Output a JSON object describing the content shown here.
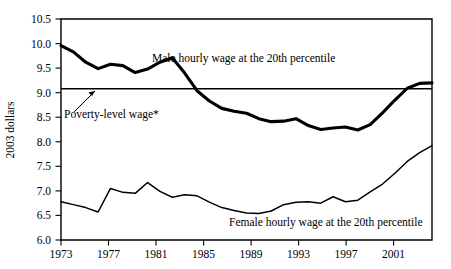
{
  "chart_data": {
    "type": "line",
    "title": "",
    "xlabel": "",
    "ylabel": "2003 dollars",
    "xlim": [
      1973,
      2003
    ],
    "ylim": [
      6.0,
      10.5
    ],
    "grid": false,
    "legend_position": "inline-annotation",
    "x_tick_labels": [
      "1973",
      "1977",
      "1981",
      "1985",
      "1989",
      "1993",
      "1997",
      "2001"
    ],
    "x_ticks": [
      1973,
      1977,
      1981,
      1985,
      1989,
      1993,
      1997,
      2001
    ],
    "y_tick_labels": [
      "6.0",
      "6.5",
      "7.0",
      "7.5",
      "8.0",
      "8.5",
      "9.0",
      "9.5",
      "10.0",
      "10.5"
    ],
    "y_ticks": [
      6.0,
      6.5,
      7.0,
      7.5,
      8.0,
      8.5,
      9.0,
      9.5,
      10.0,
      10.5
    ],
    "x": [
      1973,
      1974,
      1975,
      1976,
      1977,
      1978,
      1979,
      1980,
      1981,
      1982,
      1983,
      1984,
      1985,
      1986,
      1987,
      1988,
      1989,
      1990,
      1991,
      1992,
      1993,
      1994,
      1995,
      1996,
      1997,
      1998,
      1999,
      2000,
      2001,
      2002,
      2003
    ],
    "series": [
      {
        "name": "Male hourly wage at the 20th percentile",
        "style": "thick-black-line",
        "values": [
          9.96,
          9.83,
          9.62,
          9.49,
          9.58,
          9.55,
          9.41,
          9.48,
          9.62,
          9.71,
          9.4,
          9.04,
          8.83,
          8.68,
          8.62,
          8.58,
          8.47,
          8.41,
          8.42,
          8.47,
          8.33,
          8.25,
          8.28,
          8.3,
          8.24,
          8.35,
          8.59,
          8.85,
          9.09,
          9.19,
          9.2
        ]
      },
      {
        "name": "Female hourly wage at the 20th percentile",
        "style": "thin-black-line",
        "values": [
          6.78,
          6.72,
          6.66,
          6.57,
          7.05,
          6.97,
          6.95,
          7.17,
          6.99,
          6.87,
          6.92,
          6.9,
          6.77,
          6.66,
          6.6,
          6.55,
          6.54,
          6.59,
          6.72,
          6.77,
          6.78,
          6.75,
          6.88,
          6.78,
          6.81,
          6.98,
          7.14,
          7.36,
          7.6,
          7.78,
          7.92
        ]
      }
    ],
    "reference_lines": [
      {
        "name": "Poverty-level wage*",
        "value": 9.08,
        "label": "Poverty-level wage*",
        "style": "horizontal-rule"
      }
    ],
    "annotations": [
      {
        "name": "male-series-annotation",
        "text": "Male hourly wage at the 20th percentile"
      },
      {
        "name": "female-series-annotation",
        "text": "Female hourly wage at the 20th percentile"
      },
      {
        "name": "poverty-line-annotation",
        "text": "Poverty-level wage*"
      }
    ]
  },
  "axes": {
    "y_title": "2003 dollars"
  },
  "colors": {
    "line": "#000000",
    "background": "#ffffff",
    "axis": "#000000"
  }
}
